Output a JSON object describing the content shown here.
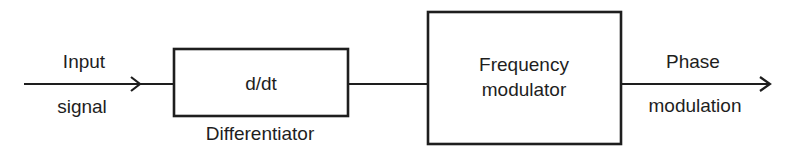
{
  "diagram": {
    "colors": {
      "stroke": "#1e1e1e",
      "background": "#ffffff",
      "text": "#1e1e1e"
    },
    "input": {
      "line1": "Input",
      "line2": "signal"
    },
    "differentiator": {
      "content": "d/dt",
      "caption": "Differentiator"
    },
    "frequency_modulator": {
      "line1": "Frequency",
      "line2": "modulator"
    },
    "output": {
      "line1": "Phase",
      "line2": "modulation"
    },
    "flow": [
      "Input signal",
      "Differentiator (d/dt)",
      "Frequency modulator",
      "Phase modulation"
    ]
  }
}
